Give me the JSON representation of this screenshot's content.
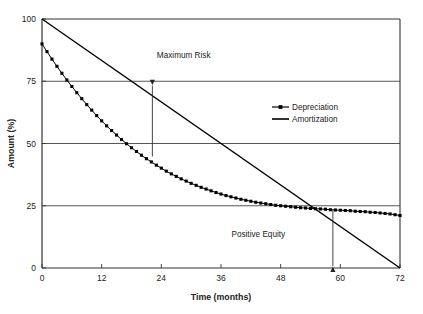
{
  "chart_data": {
    "type": "line",
    "title": "",
    "xlabel": "Time (months)",
    "ylabel": "Amount (%)",
    "xlim": [
      0,
      72
    ],
    "ylim": [
      0,
      100
    ],
    "xticks": [
      0,
      12,
      24,
      36,
      48,
      60,
      72
    ],
    "yticks": [
      0,
      25,
      50,
      75,
      100
    ],
    "xtick_labels": [
      "0",
      "12",
      "24",
      "36",
      "48",
      "60",
      "72"
    ],
    "ytick_labels": [
      "0",
      "25",
      "50",
      "75",
      "100"
    ],
    "grid": "horizontal",
    "legend_position": "center-right",
    "series": [
      {
        "name": "Depreciation",
        "marker": "filled-square",
        "line_style": "solid",
        "color": "#000000",
        "x": [
          0,
          1,
          2,
          3,
          4,
          5,
          6,
          7,
          8,
          9,
          10,
          11,
          12,
          13,
          14,
          15,
          16,
          17,
          18,
          19,
          20,
          21,
          22,
          23,
          24,
          25,
          26,
          27,
          28,
          29,
          30,
          31,
          32,
          33,
          34,
          35,
          36,
          37,
          38,
          39,
          40,
          41,
          42,
          43,
          44,
          45,
          46,
          47,
          48,
          49,
          50,
          51,
          52,
          53,
          54,
          55,
          56,
          57,
          58,
          59,
          60,
          61,
          62,
          63,
          64,
          65,
          66,
          67,
          68,
          69,
          70,
          71,
          72
        ],
        "values": [
          90.0,
          86.9,
          83.9,
          81.0,
          78.2,
          75.5,
          72.9,
          70.4,
          68.0,
          65.6,
          63.4,
          61.2,
          59.1,
          57.1,
          55.2,
          53.4,
          51.6,
          49.9,
          48.3,
          46.8,
          45.3,
          43.9,
          42.6,
          41.3,
          40.1,
          38.9,
          37.8,
          36.8,
          35.8,
          34.9,
          34.0,
          33.2,
          32.4,
          31.7,
          31.0,
          30.3,
          29.7,
          29.1,
          28.6,
          28.1,
          27.6,
          27.2,
          26.8,
          26.4,
          26.1,
          25.8,
          25.5,
          25.2,
          25.0,
          24.8,
          24.6,
          24.4,
          24.2,
          24.1,
          23.9,
          23.8,
          23.7,
          23.6,
          23.4,
          23.3,
          23.2,
          23.1,
          23.0,
          22.8,
          22.7,
          22.6,
          22.4,
          22.3,
          22.1,
          21.9,
          21.7,
          21.4,
          21.1
        ]
      },
      {
        "name": "Amortization",
        "marker": "none",
        "line_style": "solid",
        "color": "#000000",
        "x": [
          0,
          72
        ],
        "values": [
          100,
          0
        ]
      }
    ],
    "annotations": [
      {
        "text": "Maximum Risk",
        "label_x": 28.5,
        "label_y": 85.5,
        "arrow": {
          "x": 22.2,
          "y_from": 44.8,
          "y_to": 73.5,
          "head": "end"
        }
      },
      {
        "text": "Positive Equity",
        "label_x": 43.5,
        "label_y": 13.5,
        "arrow": {
          "x": 58.5,
          "y_from": 23.3,
          "y_to": 0.5,
          "head": "end"
        }
      }
    ]
  },
  "colors": {
    "axis": "#333333",
    "grid": "#444444",
    "series": "#000000",
    "text": "#222222",
    "background": "#ffffff"
  }
}
